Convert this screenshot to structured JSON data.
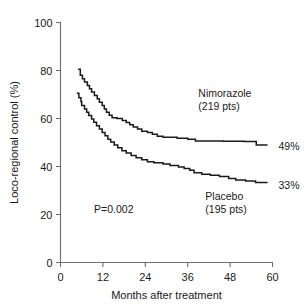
{
  "chart_data": {
    "type": "line",
    "title": "",
    "subtitle": "",
    "xlabel": "Months after treatment",
    "ylabel": "Loco-regional control (%)",
    "xlim": [
      0,
      60
    ],
    "ylim": [
      0,
      100
    ],
    "xticks": [
      0,
      12,
      24,
      36,
      48,
      60
    ],
    "yticks": [
      0,
      20,
      40,
      60,
      80,
      100
    ],
    "xtick_labels": [
      "0",
      "12",
      "24",
      "36",
      "48",
      "60"
    ],
    "ytick_labels": [
      "0",
      "20",
      "40",
      "60",
      "80",
      "100"
    ],
    "grid": false,
    "legend_position": "inline-annotation",
    "step_style": "post",
    "annotations": [
      {
        "id": "pvalue",
        "text": "P=0.002",
        "x": 9.5,
        "y": 20.5
      },
      {
        "id": "nimorazole-label-line1",
        "text": "Nimorazole",
        "x": 39,
        "y": 69
      },
      {
        "id": "nimorazole-label-line2",
        "text": "(219 pts)",
        "x": 39,
        "y": 63.5
      },
      {
        "id": "placebo-label-line1",
        "text": "Placebo",
        "x": 41,
        "y": 26
      },
      {
        "id": "placebo-label-line2",
        "text": "(195 pts)",
        "x": 41,
        "y": 20.5
      }
    ],
    "series": [
      {
        "name": "Nimorazole",
        "patients": 219,
        "patients_label": "(219 pts)",
        "end_label": "49%",
        "end_value": 49,
        "color": "#1a1a1a",
        "points": [
          [
            5.0,
            80.5
          ],
          [
            5.6,
            80.5
          ],
          [
            5.6,
            78.0
          ],
          [
            6.2,
            78.0
          ],
          [
            6.2,
            76.6
          ],
          [
            6.8,
            76.6
          ],
          [
            6.8,
            75.2
          ],
          [
            7.6,
            75.2
          ],
          [
            7.6,
            73.8
          ],
          [
            8.2,
            73.8
          ],
          [
            8.2,
            72.4
          ],
          [
            8.8,
            72.4
          ],
          [
            8.8,
            71.0
          ],
          [
            9.6,
            71.0
          ],
          [
            9.6,
            69.6
          ],
          [
            10.4,
            69.6
          ],
          [
            10.4,
            68.2
          ],
          [
            11.0,
            68.2
          ],
          [
            11.0,
            66.8
          ],
          [
            11.8,
            66.8
          ],
          [
            11.8,
            65.4
          ],
          [
            12.4,
            65.4
          ],
          [
            12.4,
            64.0
          ],
          [
            13.0,
            64.0
          ],
          [
            13.0,
            62.6
          ],
          [
            13.8,
            62.6
          ],
          [
            13.8,
            61.4
          ],
          [
            14.6,
            61.4
          ],
          [
            14.6,
            60.3
          ],
          [
            16.0,
            60.3
          ],
          [
            16.0,
            60.0
          ],
          [
            17.5,
            60.0
          ],
          [
            17.5,
            59.2
          ],
          [
            18.6,
            59.2
          ],
          [
            18.6,
            58.3
          ],
          [
            19.6,
            58.3
          ],
          [
            19.6,
            57.4
          ],
          [
            20.6,
            57.4
          ],
          [
            20.6,
            56.5
          ],
          [
            21.8,
            56.5
          ],
          [
            21.8,
            55.6
          ],
          [
            23.0,
            55.6
          ],
          [
            23.0,
            54.7
          ],
          [
            24.6,
            54.7
          ],
          [
            24.6,
            54.2
          ],
          [
            26.0,
            54.2
          ],
          [
            26.0,
            53.4
          ],
          [
            27.4,
            53.4
          ],
          [
            27.4,
            52.6
          ],
          [
            29.0,
            52.6
          ],
          [
            29.0,
            52.2
          ],
          [
            33.0,
            52.2
          ],
          [
            33.0,
            51.8
          ],
          [
            36.0,
            51.8
          ],
          [
            36.0,
            51.4
          ],
          [
            38.2,
            51.4
          ],
          [
            38.2,
            50.6
          ],
          [
            46.0,
            50.6
          ],
          [
            46.0,
            50.5
          ],
          [
            52.0,
            50.5
          ],
          [
            52.0,
            50.4
          ],
          [
            55.4,
            50.4
          ],
          [
            55.4,
            49.0
          ],
          [
            58.6,
            49.0
          ]
        ]
      },
      {
        "name": "Placebo",
        "patients": 195,
        "patients_label": "(195 pts)",
        "end_label": "33%",
        "end_value": 33,
        "color": "#1a1a1a",
        "points": [
          [
            4.6,
            70.5
          ],
          [
            5.2,
            70.5
          ],
          [
            5.2,
            68.6
          ],
          [
            5.8,
            68.6
          ],
          [
            5.8,
            67.0
          ],
          [
            6.0,
            67.0
          ],
          [
            6.0,
            65.4
          ],
          [
            6.8,
            65.4
          ],
          [
            6.8,
            64.0
          ],
          [
            7.4,
            64.0
          ],
          [
            7.4,
            62.6
          ],
          [
            8.0,
            62.6
          ],
          [
            8.0,
            61.2
          ],
          [
            8.8,
            61.2
          ],
          [
            8.8,
            59.8
          ],
          [
            9.4,
            59.8
          ],
          [
            9.4,
            58.4
          ],
          [
            10.2,
            58.4
          ],
          [
            10.2,
            57.0
          ],
          [
            11.0,
            57.0
          ],
          [
            11.0,
            55.6
          ],
          [
            11.8,
            55.6
          ],
          [
            11.8,
            54.2
          ],
          [
            12.6,
            54.2
          ],
          [
            12.6,
            52.8
          ],
          [
            13.4,
            52.8
          ],
          [
            13.4,
            51.4
          ],
          [
            14.2,
            51.4
          ],
          [
            14.2,
            50.2
          ],
          [
            15.2,
            50.2
          ],
          [
            15.2,
            49.0
          ],
          [
            16.2,
            49.0
          ],
          [
            16.2,
            47.8
          ],
          [
            17.4,
            47.8
          ],
          [
            17.4,
            46.6
          ],
          [
            18.6,
            46.6
          ],
          [
            18.6,
            45.6
          ],
          [
            20.0,
            45.6
          ],
          [
            20.0,
            44.6
          ],
          [
            21.4,
            44.6
          ],
          [
            21.4,
            43.6
          ],
          [
            23.0,
            43.6
          ],
          [
            23.0,
            42.8
          ],
          [
            24.6,
            42.8
          ],
          [
            24.6,
            42.0
          ],
          [
            26.4,
            42.0
          ],
          [
            26.4,
            41.6
          ],
          [
            29.0,
            41.6
          ],
          [
            29.0,
            41.0
          ],
          [
            31.0,
            41.0
          ],
          [
            31.0,
            40.4
          ],
          [
            33.4,
            40.4
          ],
          [
            33.4,
            39.8
          ],
          [
            35.0,
            39.8
          ],
          [
            35.0,
            39.2
          ],
          [
            36.6,
            39.2
          ],
          [
            36.6,
            38.4
          ],
          [
            37.8,
            38.4
          ],
          [
            37.8,
            37.4
          ],
          [
            40.0,
            37.4
          ],
          [
            40.0,
            36.8
          ],
          [
            42.4,
            36.8
          ],
          [
            42.4,
            36.4
          ],
          [
            45.0,
            36.4
          ],
          [
            45.0,
            35.8
          ],
          [
            47.6,
            35.8
          ],
          [
            47.6,
            35.0
          ],
          [
            49.6,
            35.0
          ],
          [
            49.6,
            34.4
          ],
          [
            52.4,
            34.4
          ],
          [
            52.4,
            34.0
          ],
          [
            55.2,
            34.0
          ],
          [
            55.2,
            33.3
          ],
          [
            58.6,
            33.3
          ]
        ]
      }
    ],
    "end_labels": [
      {
        "series": "Nimorazole",
        "text": "49%",
        "x": 61.5,
        "y": 48.5
      },
      {
        "series": "Placebo",
        "text": "33%",
        "x": 61.5,
        "y": 32.5
      }
    ],
    "colors": {
      "axis": "#6e6e6e",
      "curve": "#1a1a1a",
      "text": "#1a1a1a",
      "background": "#ffffff"
    }
  }
}
